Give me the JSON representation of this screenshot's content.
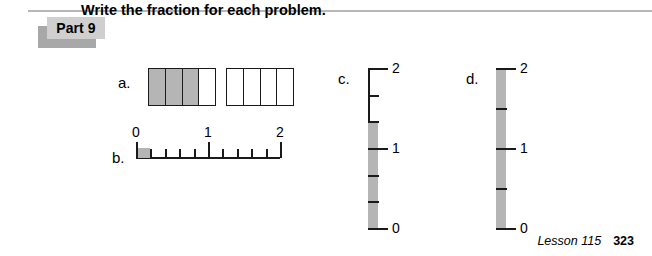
{
  "page": {
    "background_color": "#ffffff",
    "rule_color": "#b8b8b8",
    "shade_color": "#b5b5b5",
    "line_color": "#1a1a1a",
    "badge_color": "#cfcfcf",
    "badge_shadow_color": "#a8a8a8"
  },
  "header": {
    "part_label": "Part 9",
    "instruction": "Write the fraction for each problem."
  },
  "problems": {
    "a": {
      "label": "a.",
      "type": "bar-model",
      "bars": [
        {
          "divisions": 4,
          "shaded": 4,
          "filled_cells": [
            true,
            true,
            true,
            false
          ]
        },
        {
          "divisions": 4,
          "shaded": 0,
          "filled_cells": [
            false,
            false,
            false,
            false
          ]
        }
      ],
      "shaded_total": 3,
      "parts_per_whole": 4,
      "answer_fraction": "3/4"
    },
    "b": {
      "label": "b.",
      "type": "horizontal-number-line",
      "min": 0,
      "max": 2,
      "divisions_per_unit": 5,
      "tick_labels": [
        "0",
        "1",
        "2"
      ],
      "labeled_positions": [
        0,
        1,
        2
      ],
      "shaded_from": 0,
      "shaded_to": 0.2,
      "shaded_units": 1,
      "answer_fraction": "1/5"
    },
    "c": {
      "label": "c.",
      "type": "vertical-number-line",
      "min": 0,
      "max": 2,
      "divisions_total": 6,
      "divisions_per_unit": 3,
      "tick_labels": [
        "0",
        "1",
        "2"
      ],
      "labeled_positions": [
        0,
        1,
        2
      ],
      "shaded_from": 0,
      "shaded_to": 1.3333,
      "shaded_units": 4,
      "answer_fraction": "4/3"
    },
    "d": {
      "label": "d.",
      "type": "vertical-number-line",
      "min": 0,
      "max": 2,
      "divisions_total": 4,
      "divisions_per_unit": 2,
      "tick_labels": [
        "0",
        "1",
        "2"
      ],
      "labeled_positions": [
        0,
        1,
        2
      ],
      "shaded_from": 0,
      "shaded_to": 2,
      "shaded_units": 4,
      "answer_fraction": "4/2"
    }
  },
  "footer": {
    "lesson": "Lesson 115",
    "page_number": "323"
  }
}
